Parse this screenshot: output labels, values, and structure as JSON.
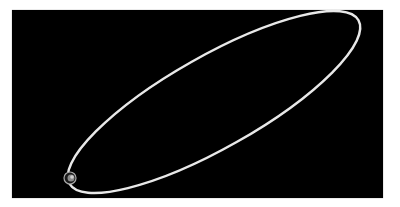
{
  "scene": {
    "background": "#000000",
    "page_background": "#ffffff",
    "ellipse": {
      "stroke": "#e8e8e8",
      "cx": 214,
      "cy": 102,
      "rx": 166,
      "ry": 46,
      "rotation_deg": -29.5
    },
    "marker": {
      "name": "small-planet",
      "cx": 70,
      "cy": 178,
      "r": 6,
      "color": "#bbbbbb"
    }
  }
}
